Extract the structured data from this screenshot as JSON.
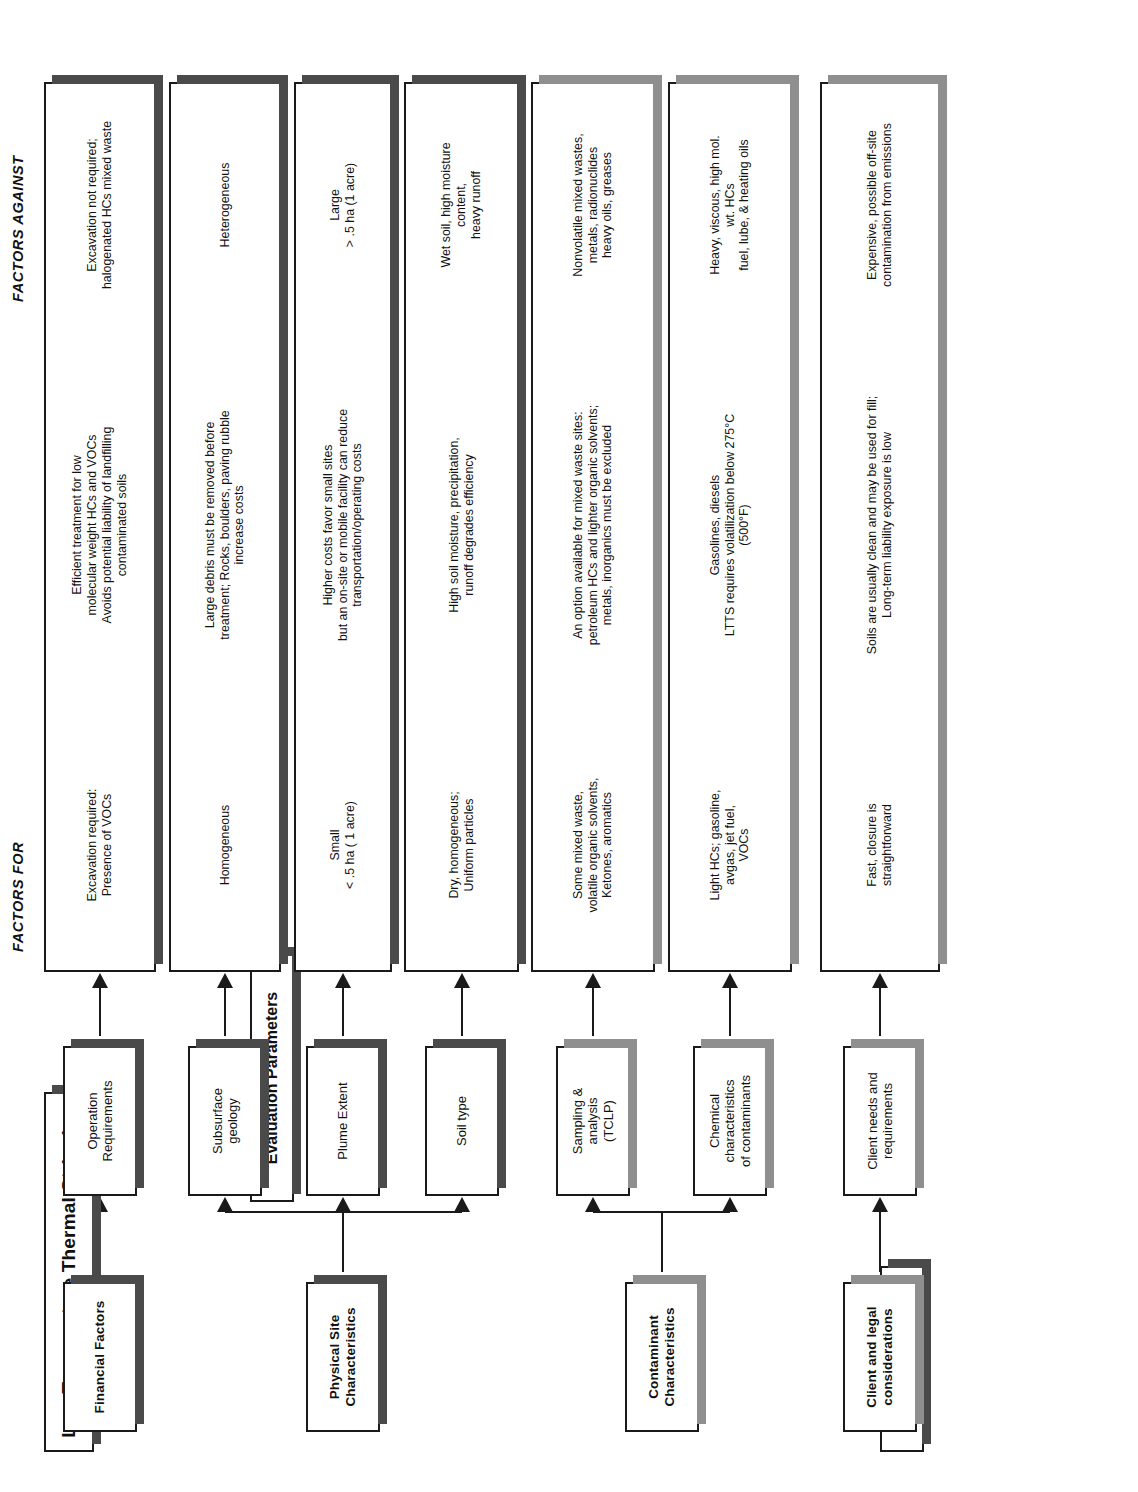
{
  "title": "Low Temperature Thermal Stripping",
  "column_headers": {
    "decision_factors": "Decision Factors",
    "evaluation_parameters": "Evaluation Parameters",
    "factors_for": "FACTORS FOR",
    "factors_against": "FACTORS AGAINST"
  },
  "groups": [
    {
      "id": "financial",
      "label": "Financial Factors"
    },
    {
      "id": "physical-site",
      "label": "Physical Site\nCharacteristics"
    },
    {
      "id": "contaminant",
      "label": "Contaminant\nCharacteristics"
    },
    {
      "id": "client-legal",
      "label": "Client and legal\nconsiderations"
    }
  ],
  "rows": [
    {
      "parameter": "Operation\nRequirements",
      "factors_for": "Excavation required:\nPresence of VOCs",
      "evaluation": "Efficient treatment for low\nmolecular weight HCs and VOCs\nAvoids potential liability of landfilling\ncontaminated soils",
      "factors_against": "Excavation not required;\nhalogenated HCs mixed waste",
      "group": "financial"
    },
    {
      "parameter": "Subsurface\ngeology",
      "factors_for": "Homogeneous",
      "evaluation": "Large debris must be removed before\ntreatment; Rocks, boulders, paving rubble\nincrease costs",
      "factors_against": "Heterogeneous",
      "group": "physical-site"
    },
    {
      "parameter": "Plume Extent",
      "factors_for": "Small\n< .5 ha ( 1 acre)",
      "evaluation": "Higher costs favor small sites\nbut an on-site or mobile facility can reduce\ntransportation/operating costs",
      "factors_against": "Large\n> .5 ha (1 acre)",
      "group": "physical-site"
    },
    {
      "parameter": "Soil type",
      "factors_for": "Dry, homogeneous;\nUniform particles",
      "evaluation": "High soil moisture, precipitation,\nrunoff degrades efficiency",
      "factors_against": "Wet soil, high moisture\ncontent,\nheavy runoff",
      "group": "physical-site"
    },
    {
      "parameter": "Sampling &\nanalysis\n(TCLP)",
      "factors_for": "Some mixed waste,\nvolatile organic solvents,\nKetones, aromatics",
      "evaluation": "An option available for mixed waste sites:\npetroleum HCs and lighter organic solvents;\nmetals, inorganics must be excluded",
      "factors_against": "Nonvolatile mixed wastes,\nmetals, radionuclides\nheavy oils, greases",
      "group": "contaminant"
    },
    {
      "parameter": "Chemical\ncharacteristics\nof contaminants",
      "factors_for": "Light HCs; gasoline,\navgas, jet fuel,\nVOCs",
      "evaluation": "Gasolines, diesels\nLTTS requires volatilization below 275°C\n(500°F)",
      "factors_against": "Heavy, viscous, high mol.\nwt. HCs\nfuel, lube, & heating oils",
      "group": "contaminant"
    },
    {
      "parameter": "Client needs and\nrequirements",
      "factors_for": "Fast, closure is\nstraightforward",
      "evaluation": "Soils are usually clean and may be used for fill;\nLong-term liability exposure is low",
      "factors_against": "Expensive, possible off-site\ncontamination from emissions",
      "group": "client-legal"
    }
  ],
  "colors": {
    "ink": "#1a1a1a",
    "shadow_dark": "#4a4a4a",
    "shadow_light": "#8f8f8f",
    "paper": "#ffffff"
  }
}
